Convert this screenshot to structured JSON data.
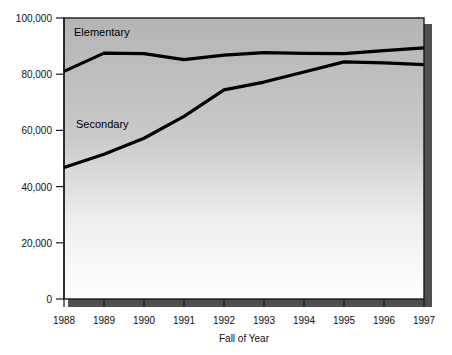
{
  "chart_data": {
    "type": "line",
    "title": "",
    "xlabel": "Fall of Year",
    "ylabel": "",
    "categories": [
      "1988",
      "1989",
      "1990",
      "1991",
      "1992",
      "1993",
      "1994",
      "1995",
      "1996",
      "1997"
    ],
    "x": [
      1988,
      1989,
      1990,
      1991,
      1992,
      1993,
      1994,
      1995,
      1996,
      1997
    ],
    "xlim": [
      1988,
      1997
    ],
    "ylim": [
      0,
      100000
    ],
    "yticks": [
      0,
      20000,
      40000,
      60000,
      80000,
      100000
    ],
    "ytick_labels": [
      "0",
      "20,000",
      "40,000",
      "60,000",
      "80,000",
      "100,000"
    ],
    "xtick_labels": [
      "1988",
      "1989",
      "1990",
      "1991",
      "1992",
      "1993",
      "1994",
      "1995",
      "1996",
      "1997"
    ],
    "grid": false,
    "legend": "inline-annotations",
    "series": [
      {
        "name": "Elementary",
        "label_text": "Elementary",
        "values": [
          81000,
          87500,
          87300,
          85200,
          86800,
          87700,
          87400,
          87300,
          88400,
          89400
        ]
      },
      {
        "name": "Secondary",
        "label_text": "Secondary",
        "values": [
          46800,
          51500,
          57200,
          65000,
          74400,
          77200,
          80800,
          84400,
          84000,
          83400
        ]
      }
    ],
    "annotations": [
      {
        "text": "Elementary",
        "x": 1988.25,
        "y": 93500
      },
      {
        "text": "Secondary",
        "x": 1988.3,
        "y": 60700
      }
    ]
  },
  "axes": {
    "x_axis_title": "Fall of Year"
  },
  "colors": {
    "line": "#000000",
    "plot_bg_top": "#b6b6b6",
    "plot_bg_bottom": "#ffffff",
    "axis": "#222222",
    "shadow": "#5a5a5a",
    "page_bg": "#ffffff"
  }
}
